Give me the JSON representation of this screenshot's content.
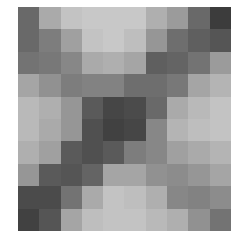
{
  "image": {
    "description": "10x10 grayscale pixelated block pattern",
    "rows": 10,
    "cols": 10,
    "grid_origin": [
      18,
      7
    ],
    "grid_size": [
      213,
      224
    ],
    "background": "#ffffff",
    "gray_values": [
      [
        105,
        170,
        195,
        200,
        200,
        200,
        175,
        155,
        105,
        60
      ],
      [
        105,
        125,
        160,
        195,
        200,
        190,
        150,
        110,
        95,
        85
      ],
      [
        115,
        120,
        135,
        170,
        175,
        165,
        95,
        100,
        115,
        155
      ],
      [
        165,
        145,
        125,
        130,
        130,
        110,
        110,
        120,
        165,
        180
      ],
      [
        185,
        175,
        150,
        90,
        70,
        75,
        105,
        170,
        185,
        195
      ],
      [
        185,
        170,
        150,
        80,
        65,
        70,
        135,
        180,
        190,
        195
      ],
      [
        175,
        160,
        90,
        80,
        90,
        125,
        135,
        160,
        170,
        180
      ],
      [
        150,
        90,
        85,
        100,
        165,
        165,
        145,
        140,
        150,
        165
      ],
      [
        75,
        75,
        115,
        170,
        195,
        190,
        175,
        135,
        130,
        140
      ],
      [
        65,
        85,
        165,
        190,
        195,
        195,
        185,
        175,
        145,
        115
      ]
    ]
  }
}
